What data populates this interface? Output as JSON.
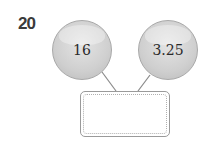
{
  "question": {
    "number": "20"
  },
  "circles": [
    {
      "value": "16"
    },
    {
      "value": "3.25"
    }
  ],
  "answer_box": {
    "value": ""
  },
  "colors": {
    "circle_fill": "#cfcfcf",
    "line": "#8a8a8a",
    "box_border": "#9a9a9a"
  }
}
